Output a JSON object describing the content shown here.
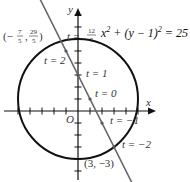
{
  "diagram": {
    "equation": {
      "base": "x",
      "exp1": "2",
      "middle": " + (y − 1)",
      "exp2": "2",
      "rhs": " = 25"
    },
    "axes": {
      "x_label": "x",
      "y_label": "y",
      "origin_label": "O"
    },
    "circle": {
      "center": [
        0,
        1
      ],
      "radius": 5
    },
    "line": {
      "param_x": "1 - t",
      "param_y": "1 + 2t",
      "color": "#666666"
    },
    "t_labels": [
      {
        "t": 2,
        "text": "t = 2"
      },
      {
        "t": 1,
        "text": "t = 1"
      },
      {
        "t": 0,
        "text": "t = 0"
      },
      {
        "t": -1,
        "text": "t = −1"
      },
      {
        "t": -2,
        "text": "t = −2"
      }
    ],
    "top_t_label": {
      "prefix": "t = ",
      "num": "12",
      "den": "5"
    },
    "intersection_points": [
      {
        "label_prefix": "(−",
        "x_num": "7",
        "x_den": "5",
        "sep": ",",
        "y_num": "29",
        "y_den": "5",
        "suffix": ")"
      },
      {
        "label": "(3, −3)"
      }
    ]
  }
}
